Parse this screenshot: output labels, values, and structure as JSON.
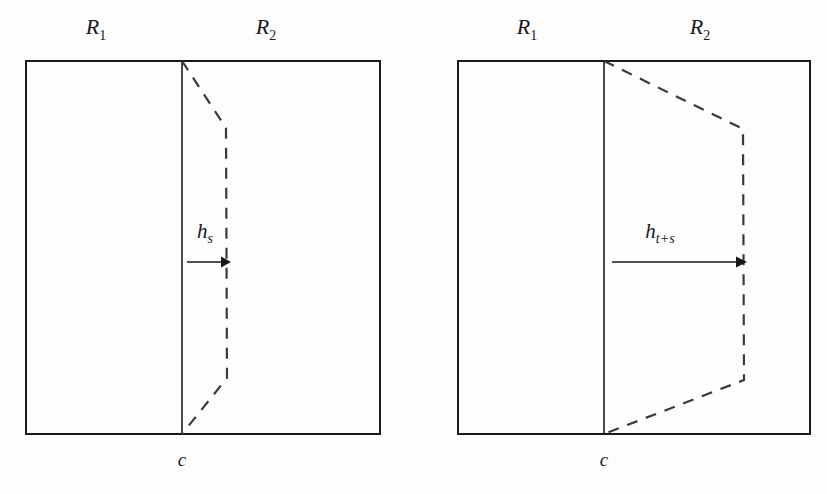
{
  "figure": {
    "type": "mathematical-diagram",
    "background_color": "#fdfdfd",
    "ink_color": "#18181a",
    "dash_color": "#3a3a3c",
    "width": 827,
    "height": 494
  },
  "panels": [
    {
      "id": "left-panel",
      "name": "panel-hs",
      "region_left_label": "R",
      "region_left_sub": "1",
      "region_right_label": "R",
      "region_right_sub": "2",
      "interface_label": "c",
      "flow_label": "h",
      "flow_sub": "s",
      "box": {
        "x": 26,
        "y": 61,
        "width": 354,
        "height": 373
      },
      "divider_x": 182,
      "dash_path": [
        {
          "x": 182,
          "y": 61
        },
        {
          "x": 226,
          "y": 128
        },
        {
          "x": 227,
          "y": 378
        },
        {
          "x": 182,
          "y": 434
        }
      ],
      "arrow": {
        "x1": 187,
        "y1": 262,
        "x2": 228,
        "y2": 262
      },
      "flow_label_pos": {
        "x": 205,
        "y": 238
      },
      "region_left_pos": {
        "x": 96,
        "y": 34
      },
      "region_right_pos": {
        "x": 266,
        "y": 34
      },
      "interface_label_pos": {
        "x": 182,
        "y": 466
      }
    },
    {
      "id": "right-panel",
      "name": "panel-hts",
      "region_left_label": "R",
      "region_left_sub": "1",
      "region_right_label": "R",
      "region_right_sub": "2",
      "interface_label": "c",
      "flow_label": "h",
      "flow_sub": "t+s",
      "box": {
        "x": 458,
        "y": 61,
        "width": 352,
        "height": 373
      },
      "divider_x": 604,
      "dash_path": [
        {
          "x": 604,
          "y": 61
        },
        {
          "x": 743,
          "y": 129
        },
        {
          "x": 744,
          "y": 380
        },
        {
          "x": 604,
          "y": 434
        }
      ],
      "arrow": {
        "x1": 612,
        "y1": 262,
        "x2": 745,
        "y2": 262
      },
      "flow_label_pos": {
        "x": 660,
        "y": 238
      },
      "region_left_pos": {
        "x": 527,
        "y": 34
      },
      "region_right_pos": {
        "x": 700,
        "y": 34
      },
      "interface_label_pos": {
        "x": 604,
        "y": 466
      }
    }
  ]
}
